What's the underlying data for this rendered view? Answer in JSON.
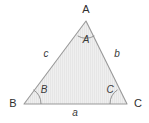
{
  "figure": {
    "type": "triangle-diagram",
    "background_color": "#ffffff",
    "fill_color": "#eeeeee",
    "hatch_color": "#e2e2e2",
    "stroke_color": "#999999",
    "arc_color": "#888888",
    "text_color": "#3a3a3a"
  },
  "vertices": [
    {
      "id": "A",
      "label": "A",
      "x": 86,
      "y": 21,
      "label_x": 86,
      "label_y": 9
    },
    {
      "id": "B",
      "label": "B",
      "x": 24,
      "y": 104,
      "label_x": 13,
      "label_y": 103
    },
    {
      "id": "C",
      "label": "C",
      "x": 127,
      "y": 104,
      "label_x": 138,
      "label_y": 103
    }
  ],
  "angles": [
    {
      "id": "angle-A",
      "label": "A",
      "label_x": 86,
      "label_y": 40,
      "arc_radius": 17
    },
    {
      "id": "angle-B",
      "label": "B",
      "label_x": 44,
      "label_y": 90,
      "arc_radius": 17
    },
    {
      "id": "angle-C",
      "label": "C",
      "label_x": 110,
      "label_y": 90,
      "arc_radius": 17
    }
  ],
  "sides": [
    {
      "id": "side-a",
      "label": "a",
      "opposite_vertex": "A",
      "label_x": 75,
      "label_y": 113
    },
    {
      "id": "side-b",
      "label": "b",
      "opposite_vertex": "B",
      "label_x": 117,
      "label_y": 54
    },
    {
      "id": "side-c",
      "label": "c",
      "opposite_vertex": "C",
      "label_x": 46,
      "label_y": 54
    }
  ]
}
